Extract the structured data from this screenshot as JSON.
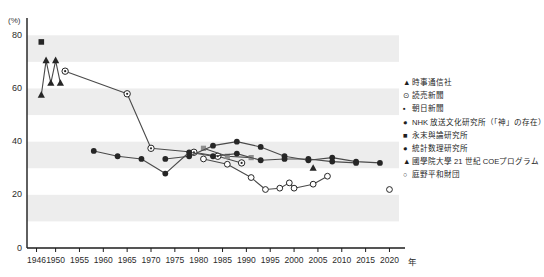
{
  "top_cutoff_text": "",
  "axis": {
    "y_unit": "(%)",
    "y_ticks": [
      0,
      20,
      40,
      60,
      80
    ],
    "x_unit": "年",
    "x_ticks": [
      1946,
      1950,
      1955,
      1960,
      1965,
      1970,
      1975,
      1980,
      1985,
      1990,
      1995,
      2000,
      2005,
      2010,
      2015,
      2020
    ]
  },
  "legend": {
    "items": [
      {
        "marker": "filled-triangle",
        "glyph": "▲",
        "label": "時事通信社"
      },
      {
        "marker": "target-circle",
        "glyph": "⊙",
        "label": "読売新聞"
      },
      {
        "marker": "small-square",
        "glyph": "▪",
        "label": "朝日新聞"
      },
      {
        "marker": "filled-circle",
        "glyph": "●",
        "label": "NHK 放送文化研究所（「神」の存在）"
      },
      {
        "marker": "filled-square",
        "glyph": "■",
        "label": "永末與論研究所"
      },
      {
        "marker": "filled-circle",
        "glyph": "●",
        "label": "統計数理研究所"
      },
      {
        "marker": "filled-triangle",
        "glyph": "▲",
        "label": "國學院大學 21 世紀 COEプログラム"
      },
      {
        "marker": "open-circle",
        "glyph": "○",
        "label": "庭野平和財団"
      }
    ]
  },
  "colors": {
    "axis": "#1c1c1c",
    "band": "#ededed",
    "line": "#4a4a4a",
    "marker_fill": "#262626",
    "marker_open": "#ffffff",
    "text": "#1f1f1f"
  },
  "chart_data": {
    "type": "line",
    "title": "",
    "xlabel": "年",
    "ylabel": "(%)",
    "xlim": [
      1944,
      2022
    ],
    "ylim": [
      0,
      85
    ],
    "grid": "horizontal-bands-10",
    "legend_position": "right",
    "series": [
      {
        "name": "時事通信社",
        "marker": "filled-triangle",
        "connected": true,
        "points": [
          {
            "x": 1947,
            "y": 57.5
          },
          {
            "x": 1948,
            "y": 70.5
          },
          {
            "x": 1949,
            "y": 62.0
          },
          {
            "x": 1950,
            "y": 70.5
          },
          {
            "x": 1951,
            "y": 62.0
          }
        ]
      },
      {
        "name": "讀売新聞",
        "marker": "target-circle",
        "connected": true,
        "points": [
          {
            "x": 1952,
            "y": 66.5
          },
          {
            "x": 1965,
            "y": 58.0
          },
          {
            "x": 1970,
            "y": 37.5
          },
          {
            "x": 1979,
            "y": 36.0
          },
          {
            "x": 1984,
            "y": 34.5
          },
          {
            "x": 1989,
            "y": 32.0
          }
        ]
      },
      {
        "name": "朝日新聞",
        "marker": "small-square",
        "connected": true,
        "points": [
          {
            "x": 1981,
            "y": 37.5
          },
          {
            "x": 1986,
            "y": 34.5
          },
          {
            "x": 1991,
            "y": 34.0
          }
        ]
      },
      {
        "name": "NHK 放送文化研究所（「神」の存在）",
        "marker": "filled-circle",
        "connected": true,
        "points": [
          {
            "x": 1973,
            "y": 33.5
          },
          {
            "x": 1978,
            "y": 34.5
          },
          {
            "x": 1983,
            "y": 38.5
          },
          {
            "x": 1988,
            "y": 40.0
          },
          {
            "x": 1993,
            "y": 38.0
          },
          {
            "x": 1998,
            "y": 34.5
          },
          {
            "x": 2003,
            "y": 33.0
          },
          {
            "x": 2008,
            "y": 34.0
          },
          {
            "x": 2013,
            "y": 32.5
          },
          {
            "x": 2018,
            "y": 32.0
          }
        ]
      },
      {
        "name": "永末與論研究所",
        "marker": "filled-square",
        "connected": false,
        "points": [
          {
            "x": 1947,
            "y": 77.5
          }
        ]
      },
      {
        "name": "統計数理研究所",
        "marker": "filled-circle",
        "connected": true,
        "points": [
          {
            "x": 1958,
            "y": 36.5
          },
          {
            "x": 1963,
            "y": 34.5
          },
          {
            "x": 1968,
            "y": 33.5
          },
          {
            "x": 1973,
            "y": 28.0
          },
          {
            "x": 1978,
            "y": 36.0
          },
          {
            "x": 1983,
            "y": 34.5
          },
          {
            "x": 1988,
            "y": 35.5
          },
          {
            "x": 1993,
            "y": 33.0
          },
          {
            "x": 1998,
            "y": 33.5
          },
          {
            "x": 2003,
            "y": 33.5
          },
          {
            "x": 2008,
            "y": 32.5
          },
          {
            "x": 2013,
            "y": 32.0
          }
        ]
      },
      {
        "name": "國學院大學 21 世紀 COEプログラム",
        "marker": "filled-triangle",
        "connected": false,
        "points": [
          {
            "x": 2004,
            "y": 30.0
          }
        ]
      },
      {
        "name": "庭野平和財団",
        "marker": "open-circle",
        "connected": true,
        "points": [
          {
            "x": 1981,
            "y": 33.5
          },
          {
            "x": 1986,
            "y": 31.5
          },
          {
            "x": 1991,
            "y": 26.5
          },
          {
            "x": 1994,
            "y": 22.0
          },
          {
            "x": 1997,
            "y": 22.5
          },
          {
            "x": 1999,
            "y": 24.5
          },
          {
            "x": 2000,
            "y": 22.5
          },
          {
            "x": 2004,
            "y": 24.0
          },
          {
            "x": 2007,
            "y": 27.0
          }
        ]
      },
      {
        "name": "庭野平和財団 (isolated)",
        "marker": "open-circle",
        "connected": false,
        "points": [
          {
            "x": 2020,
            "y": 22.0
          }
        ]
      }
    ]
  }
}
